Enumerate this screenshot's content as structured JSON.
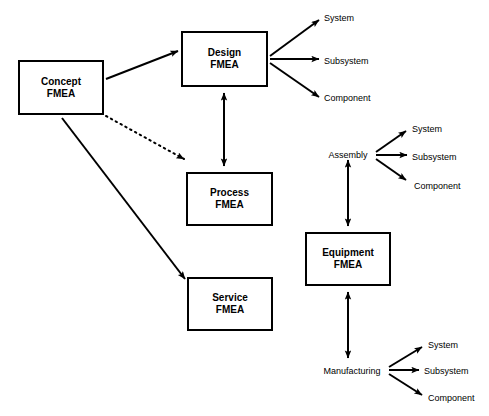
{
  "diagram": {
    "background_color": "#ffffff",
    "line_color": "#000000",
    "boxes": [
      {
        "id": "concept",
        "label": "Concept\nFMEA",
        "x": 18,
        "y": 60,
        "w": 86,
        "h": 55
      },
      {
        "id": "design",
        "label": "Design\nFMEA",
        "x": 181,
        "y": 31,
        "w": 87,
        "h": 56
      },
      {
        "id": "process",
        "label": "Process\nFMEA",
        "x": 186,
        "y": 172,
        "w": 87,
        "h": 54
      },
      {
        "id": "service",
        "label": "Service\nFMEA",
        "x": 187,
        "y": 277,
        "w": 86,
        "h": 54
      },
      {
        "id": "equipment",
        "label": "Equipment\nFMEA",
        "x": 305,
        "y": 232,
        "w": 86,
        "h": 54
      }
    ],
    "labels": [
      {
        "id": "design-system",
        "text": "System",
        "x": 324,
        "y": 13,
        "anchor": "left"
      },
      {
        "id": "design-subsystem",
        "text": "Subsystem",
        "x": 324,
        "y": 56,
        "anchor": "left"
      },
      {
        "id": "design-component",
        "text": "Component",
        "x": 324,
        "y": 93,
        "anchor": "left"
      },
      {
        "id": "assembly",
        "text": "Assembly",
        "x": 348,
        "y": 150,
        "anchor": "center"
      },
      {
        "id": "assembly-system",
        "text": "System",
        "x": 412,
        "y": 124,
        "anchor": "left"
      },
      {
        "id": "assembly-subsystem",
        "text": "Subsystem",
        "x": 412,
        "y": 152,
        "anchor": "left"
      },
      {
        "id": "assembly-component",
        "text": "Component",
        "x": 414,
        "y": 181,
        "anchor": "left"
      },
      {
        "id": "manufacturing",
        "text": "Manufacturing",
        "x": 352,
        "y": 366,
        "anchor": "center"
      },
      {
        "id": "manufacturing-system",
        "text": "System",
        "x": 428,
        "y": 340,
        "anchor": "left"
      },
      {
        "id": "manufacturing-subsystem",
        "text": "Subsystem",
        "x": 424,
        "y": 366,
        "anchor": "left"
      },
      {
        "id": "manufacturing-component",
        "text": "Component",
        "x": 428,
        "y": 393,
        "anchor": "left"
      }
    ],
    "connectors": [
      {
        "id": "concept-to-design",
        "style": "solid",
        "heads": "end",
        "from": "Concept FMEA",
        "to": "Design FMEA"
      },
      {
        "id": "concept-to-process",
        "style": "dotted",
        "heads": "end",
        "from": "Concept FMEA",
        "to": "Process FMEA"
      },
      {
        "id": "concept-to-service",
        "style": "solid",
        "heads": "end",
        "from": "Concept FMEA",
        "to": "Service FMEA"
      },
      {
        "id": "design-to-process",
        "style": "solid",
        "heads": "both",
        "from": "Design FMEA",
        "to": "Process FMEA"
      },
      {
        "id": "design-to-system",
        "style": "solid",
        "heads": "end",
        "from": "Design FMEA",
        "to": "System"
      },
      {
        "id": "design-to-subsystem",
        "style": "solid",
        "heads": "end",
        "from": "Design FMEA",
        "to": "Subsystem"
      },
      {
        "id": "design-to-component",
        "style": "solid",
        "heads": "end",
        "from": "Design FMEA",
        "to": "Component"
      },
      {
        "id": "assembly-to-equipment",
        "style": "solid",
        "heads": "both",
        "from": "Assembly",
        "to": "Equipment FMEA"
      },
      {
        "id": "assembly-to-system",
        "style": "solid",
        "heads": "end",
        "from": "Assembly",
        "to": "System"
      },
      {
        "id": "assembly-to-subsystem",
        "style": "solid",
        "heads": "end",
        "from": "Assembly",
        "to": "Subsystem"
      },
      {
        "id": "assembly-to-component",
        "style": "solid",
        "heads": "end",
        "from": "Assembly",
        "to": "Component"
      },
      {
        "id": "equipment-to-manufacturing",
        "style": "solid",
        "heads": "both",
        "from": "Equipment FMEA",
        "to": "Manufacturing"
      },
      {
        "id": "manufacturing-to-system",
        "style": "solid",
        "heads": "end",
        "from": "Manufacturing",
        "to": "System"
      },
      {
        "id": "manufacturing-to-subsystem",
        "style": "solid",
        "heads": "end",
        "from": "Manufacturing",
        "to": "Subsystem"
      },
      {
        "id": "manufacturing-to-component",
        "style": "solid",
        "heads": "end",
        "from": "Manufacturing",
        "to": "Component"
      }
    ]
  }
}
